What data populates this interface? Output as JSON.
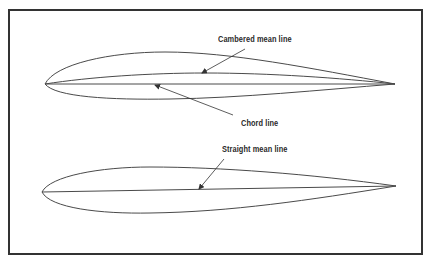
{
  "diagram": {
    "type": "airfoil-mean-line-comparison",
    "colors": {
      "frame": "#333333",
      "line": "#4a4a4a",
      "text": "#2a2a2a",
      "background": "#ffffff"
    },
    "airfoils": [
      {
        "name": "cambered-airfoil",
        "labels": [
          {
            "text": "Cambered mean line",
            "points_to": "camber-line"
          },
          {
            "text": "Chord line",
            "points_to": "chord-line"
          }
        ]
      },
      {
        "name": "symmetric-airfoil",
        "labels": [
          {
            "text": "Straight mean line",
            "points_to": "mean-line"
          }
        ]
      }
    ]
  }
}
